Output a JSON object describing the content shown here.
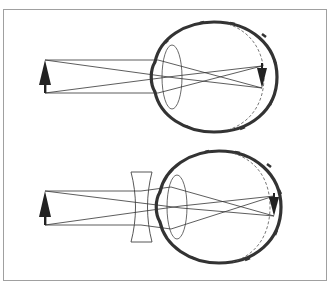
{
  "figure": {
    "frame": {
      "x": 3,
      "y": 9,
      "width": 323,
      "height": 271,
      "stroke": "#a0a0a0"
    },
    "colors": {
      "ink": "#222222",
      "eye_wall": "#333333",
      "frame": "#a0a0a0",
      "background": "#ffffff"
    },
    "panels": [
      {
        "name": "uncorrected-myopic-eye",
        "object_arrow": {
          "x": 45,
          "tip_y": 60,
          "base_y": 85,
          "stem_bottom": 93
        },
        "eye": {
          "cx": 214,
          "cy": 77,
          "rx": 62,
          "ry": 55
        },
        "crystalline_lens": {
          "cx": 172,
          "cy": 77,
          "rx": 10,
          "ry": 32
        },
        "retina_image_arrow": {
          "x": 262,
          "top_y": 66,
          "tip_y": 88
        },
        "retina_dashed_arc": true,
        "corrective_lens": null
      },
      {
        "name": "corrected-eye-concave-lens",
        "object_arrow": {
          "x": 45,
          "tip_y": 191,
          "base_y": 217,
          "stem_bottom": 225
        },
        "eye": {
          "cx": 219,
          "cy": 207,
          "rx": 62,
          "ry": 56
        },
        "crystalline_lens": {
          "cx": 177,
          "cy": 207,
          "rx": 10,
          "ry": 32
        },
        "retina_image_arrow": {
          "x": 274,
          "top_y": 196,
          "tip_y": 216
        },
        "retina_dashed_arc": true,
        "corrective_lens": {
          "type": "concave",
          "left": 131,
          "right": 152,
          "top": 172,
          "bottom": 242,
          "waist": 5
        }
      }
    ]
  }
}
